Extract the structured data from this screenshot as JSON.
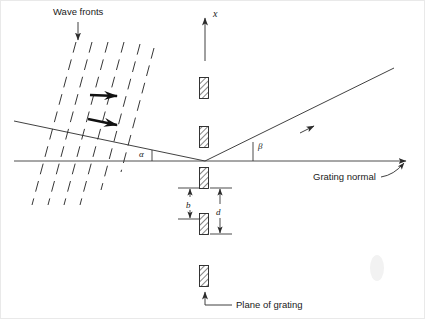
{
  "figure": {
    "background_color": "#ffffff",
    "line_color": "#2b2b2b",
    "width": 425,
    "height": 319
  },
  "labels": {
    "wave_fronts": "Wave fronts",
    "x_axis": "x",
    "alpha": "α",
    "beta": "β",
    "grating_normal": "Grating normal",
    "plane_of_grating": "Plane of grating",
    "groove_width": "b",
    "groove_spacing": "d"
  },
  "geometry": {
    "grating_normal_axis": {
      "x1": 14,
      "y1": 161,
      "x2": 412,
      "y2": 161
    },
    "x_axis_arrow": {
      "x": 205,
      "y_top": 14,
      "y_bottom": 61
    },
    "origin": {
      "x": 205,
      "y": 161
    },
    "incident_ray": {
      "x1": 14,
      "y1": 121,
      "x2": 205,
      "y2": 161
    },
    "diffracted_ray": {
      "x1": 205,
      "y1": 161,
      "x2": 394,
      "y2": 68
    },
    "alpha_tick": {
      "x": 152,
      "y1": 149,
      "y2": 161
    },
    "beta_tick": {
      "x": 252,
      "y1": 141,
      "y2": 161
    },
    "wave_front_count": 6,
    "wave_front_angle_deg": 72,
    "grooves": [
      {
        "cx": 204,
        "cy": 88
      },
      {
        "cx": 204,
        "cy": 137
      },
      {
        "cx": 204,
        "cy": 178
      },
      {
        "cx": 204,
        "cy": 224
      },
      {
        "cx": 204,
        "cy": 276
      }
    ],
    "groove_size": {
      "w": 9,
      "h": 21
    },
    "dimension_b": {
      "x": 191,
      "y_top": 188,
      "y_bottom": 218
    },
    "dimension_d": {
      "x": 219,
      "y_top": 188,
      "y_bottom": 233
    }
  }
}
